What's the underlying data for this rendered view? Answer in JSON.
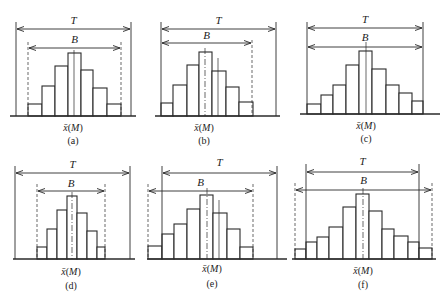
{
  "figure": {
    "width": 446,
    "height": 304,
    "stroke_color": "#2a2a2a",
    "background": "#ffffff"
  },
  "chart_data": [
    {
      "type": "bar",
      "panel": "(a)",
      "title": "",
      "xlabel": "x̄(M)",
      "annotations": [
        "T",
        "B"
      ],
      "description": "Symmetric histogram; B narrower than T and centered within tolerance",
      "bar_edges_px": [
        28,
        42,
        55,
        68,
        81,
        93,
        107,
        121
      ],
      "bar_tops_px": [
        104,
        86,
        66,
        53,
        70,
        88,
        104
      ],
      "relative_heights": [
        12,
        30,
        50,
        63,
        46,
        28,
        12
      ],
      "baseline_px": 116,
      "baseline_x_px": [
        10,
        136
      ],
      "T": {
        "left": 16,
        "right": 131,
        "arrow_y": 29,
        "line_top": 22,
        "label_y": 24
      },
      "B": {
        "left": 28,
        "right": 121,
        "arrow_y": 48,
        "dashed_left": true,
        "dashed_right": true,
        "line_top": 42,
        "label_y": 43
      },
      "center_lines": [
        {
          "x": 74,
          "top": 50,
          "style": "solid-thin"
        }
      ],
      "x_label_pos": [
        73,
        131
      ],
      "panel_label_pos": [
        73,
        144
      ]
    },
    {
      "type": "bar",
      "panel": "(b)",
      "title": "",
      "xlabel": "x̄(M)",
      "annotations": [
        "T",
        "B"
      ],
      "description": "Histogram shifted left; distribution center offset from tolerance center",
      "bar_edges_px": [
        161,
        173,
        187,
        199,
        212,
        226,
        239,
        253
      ],
      "bar_tops_px": [
        103,
        85,
        65,
        52,
        71,
        87,
        102
      ],
      "relative_heights": [
        13,
        31,
        51,
        64,
        45,
        29,
        14
      ],
      "baseline_px": 116,
      "baseline_x_px": [
        155,
        280
      ],
      "T": {
        "left": 161,
        "right": 276,
        "arrow_y": 29,
        "line_top": 22,
        "label_y": 24
      },
      "B": {
        "left": 161,
        "right": 252,
        "arrow_y": 43,
        "dashed_left": false,
        "dashed_right": true,
        "line_top": 40,
        "label_y": 39
      },
      "center_lines": [
        {
          "x": 205,
          "top": 48,
          "style": "dash-dot"
        },
        {
          "x": 218,
          "top": 58,
          "style": "solid-thin"
        }
      ],
      "x_label_pos": [
        204,
        131
      ],
      "panel_label_pos": [
        204,
        144
      ]
    },
    {
      "type": "bar",
      "panel": "(c)",
      "title": "",
      "xlabel": "x̄(M)",
      "annotations": [
        "T",
        "B"
      ],
      "description": "Spread equals tolerance; B = T",
      "bar_edges_px": [
        307,
        321,
        333,
        346,
        359,
        372,
        386,
        399,
        412,
        423
      ],
      "bar_tops_px": [
        104,
        95,
        85,
        65,
        51,
        69,
        85,
        93,
        101
      ],
      "relative_heights": [
        10,
        19,
        29,
        49,
        63,
        45,
        29,
        21,
        13
      ],
      "baseline_px": 114,
      "baseline_x_px": [
        300,
        440
      ],
      "T": {
        "left": 307,
        "right": 423,
        "arrow_y": 28,
        "line_top": 22,
        "label_y": 23
      },
      "B": {
        "left": 307,
        "right": 423,
        "arrow_y": 47,
        "dashed_left": false,
        "dashed_right": false,
        "line_top": 42,
        "label_y": 41
      },
      "center_lines": [
        {
          "x": 366,
          "top": 42,
          "style": "solid-thin"
        }
      ],
      "x_label_pos": [
        366,
        129
      ],
      "panel_label_pos": [
        366,
        142
      ]
    },
    {
      "type": "bar",
      "panel": "(d)",
      "title": "",
      "xlabel": "x̄(M)",
      "annotations": [
        "T",
        "B"
      ],
      "description": "Narrow distribution; B much smaller than T (excess capability)",
      "bar_edges_px": [
        37,
        47,
        57,
        67,
        77,
        87,
        97,
        105
      ],
      "bar_tops_px": [
        247,
        229,
        210,
        196,
        213,
        231,
        247
      ],
      "relative_heights": [
        12,
        30,
        49,
        63,
        46,
        28,
        12
      ],
      "baseline_px": 259,
      "baseline_x_px": [
        13,
        135
      ],
      "T": {
        "left": 15,
        "right": 130,
        "arrow_y": 173,
        "line_top": 166,
        "label_y": 168
      },
      "B": {
        "left": 37,
        "right": 105,
        "arrow_y": 191,
        "dashed_left": true,
        "dashed_right": true,
        "line_top": 184,
        "label_y": 187
      },
      "center_lines": [
        {
          "x": 72,
          "top": 192,
          "style": "dash-dot"
        }
      ],
      "x_label_pos": [
        71,
        275
      ],
      "panel_label_pos": [
        71,
        289
      ]
    },
    {
      "type": "bar",
      "panel": "(e)",
      "title": "",
      "xlabel": "x̄(M)",
      "annotations": [
        "T",
        "B"
      ],
      "description": "Distribution shifted left, exceeding lower tolerance limit",
      "bar_edges_px": [
        148,
        162,
        174,
        187,
        200,
        213,
        227,
        240,
        253
      ],
      "bar_tops_px": [
        246,
        234,
        224,
        209,
        195,
        213,
        229,
        247
      ],
      "relative_heights": [
        13,
        25,
        35,
        50,
        64,
        46,
        30,
        12
      ],
      "baseline_px": 259,
      "baseline_x_px": [
        147,
        287
      ],
      "T": {
        "left": 162,
        "right": 277,
        "arrow_y": 173,
        "line_top": 166,
        "label_y": 166
      },
      "B": {
        "left": 148,
        "right": 253,
        "arrow_y": 191,
        "dashed_left": true,
        "dashed_right": true,
        "line_top": 184,
        "label_y": 186
      },
      "center_lines": [
        {
          "x": 207,
          "top": 188,
          "style": "dash-dot"
        },
        {
          "x": 219,
          "top": 200,
          "style": "solid-thin"
        }
      ],
      "x_label_pos": [
        212,
        272
      ],
      "panel_label_pos": [
        212,
        287
      ]
    },
    {
      "type": "bar",
      "panel": "(f)",
      "title": "",
      "xlabel": "x̄(M)",
      "annotations": [
        "T",
        "B"
      ],
      "description": "Spread wider than tolerance on both sides (B > T)",
      "bar_edges_px": [
        295,
        306,
        317,
        329,
        343,
        356,
        369,
        382,
        394,
        408,
        419,
        432
      ],
      "bar_tops_px": [
        249,
        242,
        237,
        227,
        207,
        194,
        211,
        229,
        236,
        242,
        248
      ],
      "relative_heights": [
        10,
        17,
        22,
        32,
        52,
        65,
        48,
        30,
        23,
        17,
        11
      ],
      "baseline_px": 259,
      "baseline_x_px": [
        292,
        436
      ],
      "T": {
        "left": 306,
        "right": 419,
        "arrow_y": 172,
        "line_top": 164,
        "label_y": 165
      },
      "B": {
        "left": 295,
        "right": 432,
        "arrow_y": 190,
        "dashed_left": true,
        "dashed_right": true,
        "line_top": 183,
        "label_y": 184
      },
      "center_lines": [
        {
          "x": 363,
          "top": 188,
          "style": "dash-dot"
        }
      ],
      "x_label_pos": [
        363,
        274
      ],
      "panel_label_pos": [
        363,
        288
      ]
    }
  ],
  "labels": {
    "T": "T",
    "B": "B",
    "x_axis": "x̄(M)",
    "panels": [
      "(a)",
      "(b)",
      "(c)",
      "(d)",
      "(e)",
      "(f)"
    ]
  }
}
